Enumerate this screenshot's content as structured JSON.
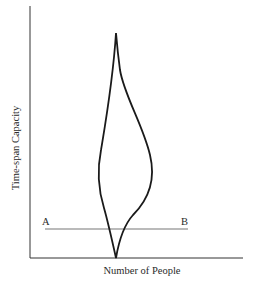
{
  "diagram": {
    "y_axis_label": "Time-span Capacity",
    "x_axis_label": "Number of People",
    "line_labels": {
      "start": "A",
      "end": "B"
    },
    "shape": "teardrop / flame-shaped distribution curve with pointed top and cusp at the base",
    "colors": {
      "background": "#ffffff",
      "curve": "#1a1a1a",
      "axes": "#333333",
      "reference_line": "#777777"
    }
  }
}
